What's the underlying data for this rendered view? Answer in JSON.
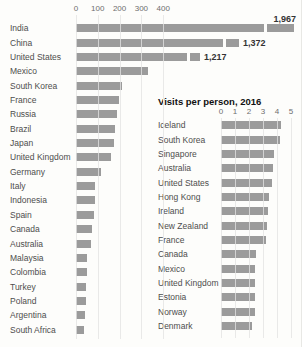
{
  "colors": {
    "background": "#fdfdfb",
    "bar": "#9b9b9b",
    "gridline": "#cfcfcd",
    "category_text": "#4d4d4d",
    "tick_text": "#6e6e6e",
    "value_label_text": "#333333",
    "title_text": "#111111"
  },
  "chart_data": [
    {
      "type": "bar",
      "orientation": "horizontal",
      "categories": [
        "India",
        "China",
        "United States",
        "Mexico",
        "South Korea",
        "France",
        "Russia",
        "Brazil",
        "Japan",
        "United Kingdom",
        "Germany",
        "Italy",
        "Indonesia",
        "Spain",
        "Canada",
        "Australia",
        "Malaysia",
        "Colombia",
        "Turkey",
        "Poland",
        "Argentina",
        "South Africa"
      ],
      "values": [
        1967,
        1372,
        1217,
        328,
        213,
        195,
        190,
        181,
        176,
        162,
        116,
        88,
        87,
        83,
        74,
        69,
        51,
        49,
        47,
        45,
        43,
        36
      ],
      "value_labels": {
        "0": "1,967",
        "1": "1,372",
        "2": "1,217"
      },
      "xticks": [
        0,
        100,
        200,
        300,
        400
      ],
      "xlim": [
        0,
        1020
      ],
      "grid": true,
      "broken_bars": [
        {
          "index": 0,
          "main_px": 188,
          "gap_px": 3,
          "cap_px": 27,
          "label_above": true
        },
        {
          "index": 1,
          "main_px": 147,
          "gap_px": 3,
          "cap_px": 13,
          "label_above": false
        },
        {
          "index": 2,
          "main_px": 111,
          "gap_px": 3,
          "cap_px": 10,
          "label_above": false
        }
      ]
    },
    {
      "type": "bar",
      "orientation": "horizontal",
      "title": "Visits per person, 2016",
      "categories": [
        "Iceland",
        "South Korea",
        "Singapore",
        "Australia",
        "United States",
        "Hong Kong",
        "Ireland",
        "New Zealand",
        "France",
        "Canada",
        "Mexico",
        "United Kingdom",
        "Estonia",
        "Norway",
        "Denmark"
      ],
      "values": [
        4.25,
        4.2,
        3.8,
        3.7,
        3.65,
        3.4,
        3.35,
        3.3,
        3.2,
        2.5,
        2.45,
        2.45,
        2.4,
        2.4,
        2.2
      ],
      "xticks": [
        0,
        1,
        2,
        3,
        4,
        5
      ],
      "xlim": [
        0,
        5.4
      ],
      "grid": true
    }
  ]
}
